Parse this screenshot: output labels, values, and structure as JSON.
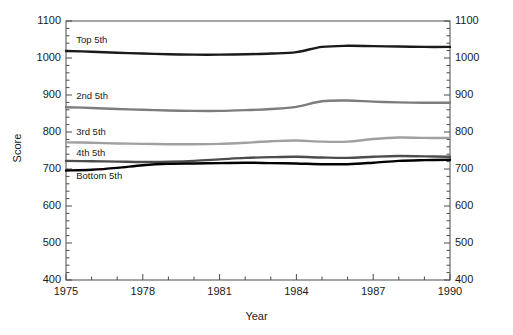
{
  "chart_data": {
    "type": "line",
    "title": "",
    "xlabel": "Year",
    "ylabel": "Score",
    "xlim": [
      1975,
      1990
    ],
    "ylim": [
      400,
      1100
    ],
    "ytick_labels": [
      "1100",
      "1000",
      "900",
      "800",
      "700",
      "600",
      "500",
      "400"
    ],
    "ytick_values": [
      1100,
      1000,
      900,
      800,
      700,
      600,
      500,
      400
    ],
    "yminor_step": 20,
    "xtick_labels": [
      "1975",
      "1978",
      "1981",
      "1984",
      "1987",
      "1990"
    ],
    "xtick_values": [
      1975,
      1978,
      1981,
      1984,
      1987,
      1990
    ],
    "xminor_step": 1,
    "grid": false,
    "legend_position": "inline-left-of-series",
    "x": [
      1975,
      1976,
      1977,
      1978,
      1979,
      1980,
      1981,
      1982,
      1983,
      1984,
      1985,
      1986,
      1987,
      1988,
      1989,
      1990
    ],
    "series": [
      {
        "name": "Top 5th",
        "color": "#1a1a1a",
        "label_x": 1975.4,
        "label_y": 1048,
        "values": [
          1019,
          1017,
          1014,
          1012,
          1010,
          1009,
          1009,
          1010,
          1012,
          1016,
          1030,
          1033,
          1032,
          1031,
          1030,
          1030
        ]
      },
      {
        "name": "2nd 5th",
        "color": "#7d7d7d",
        "label_x": 1975.4,
        "label_y": 896,
        "values": [
          867,
          865,
          862,
          860,
          858,
          857,
          857,
          859,
          862,
          868,
          883,
          885,
          882,
          880,
          879,
          879
        ]
      },
      {
        "name": "3rd 5th",
        "color": "#a0a0a0",
        "label_x": 1975.4,
        "label_y": 801,
        "values": [
          772,
          771,
          769,
          768,
          767,
          767,
          768,
          771,
          775,
          777,
          774,
          774,
          781,
          785,
          784,
          784
        ]
      },
      {
        "name": "4th 5th",
        "color": "#4d4d4d",
        "label_x": 1975.4,
        "label_y": 744,
        "values": [
          722,
          721,
          720,
          719,
          720,
          722,
          726,
          730,
          732,
          733,
          731,
          730,
          733,
          735,
          734,
          733
        ]
      },
      {
        "name": "Bottom 5th",
        "color": "#000000",
        "label_x": 1975.4,
        "label_y": 680,
        "values": [
          696,
          698,
          703,
          710,
          714,
          715,
          716,
          717,
          716,
          715,
          713,
          713,
          717,
          722,
          724,
          725
        ]
      }
    ]
  }
}
